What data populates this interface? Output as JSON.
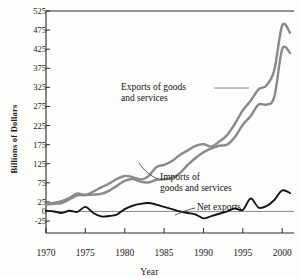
{
  "chart_data": {
    "type": "line",
    "title": "",
    "xlabel": "Year",
    "ylabel": "Billions of Dollars",
    "xlim": [
      1970,
      2001.5
    ],
    "ylim": [
      -25,
      525
    ],
    "grid": false,
    "legend_position": "inline-annotations",
    "xticks": [
      "1970",
      "1975",
      "1980",
      "1985",
      "1990",
      "1995",
      "2000"
    ],
    "xtick_values": [
      1970,
      1975,
      1980,
      1985,
      1990,
      1995,
      2000
    ],
    "yticks": [
      "525",
      "475",
      "425",
      "375",
      "325",
      "275",
      "225",
      "175",
      "125",
      "75",
      "25",
      "0",
      "-25"
    ],
    "ytick_values": [
      525,
      475,
      425,
      375,
      325,
      275,
      225,
      175,
      125,
      75,
      25,
      0,
      -25
    ],
    "x": [
      1970,
      1971,
      1972,
      1973,
      1974,
      1975,
      1976,
      1977,
      1978,
      1979,
      1980,
      1981,
      1982,
      1983,
      1984,
      1985,
      1986,
      1987,
      1988,
      1989,
      1990,
      1991,
      1992,
      1993,
      1994,
      1995,
      1996,
      1997,
      1998,
      1999,
      2000,
      2001
    ],
    "series": [
      {
        "name": "Exports of goods and services",
        "color": "#8a8a8a",
        "values": [
          18,
          20,
          22,
          32,
          42,
          43,
          44,
          46,
          54,
          67,
          80,
          85,
          78,
          76,
          83,
          84,
          88,
          100,
          122,
          140,
          155,
          165,
          172,
          175,
          195,
          227,
          250,
          280,
          280,
          300,
          425,
          415
        ]
      },
      {
        "name": "Imports of goods and services",
        "color": "#8a8a8a",
        "values": [
          20,
          22,
          27,
          36,
          47,
          43,
          52,
          63,
          73,
          85,
          93,
          90,
          84,
          92,
          116,
          122,
          132,
          148,
          160,
          172,
          176,
          170,
          183,
          200,
          230,
          265,
          290,
          320,
          330,
          370,
          487,
          468
        ]
      },
      {
        "name": "Net exports",
        "color": "#141414",
        "values": [
          2,
          0,
          -4,
          2,
          -1,
          12,
          -4,
          -13,
          -12,
          -8,
          6,
          15,
          20,
          22,
          18,
          12,
          6,
          0,
          -4,
          -8,
          -18,
          -12,
          -6,
          0,
          8,
          4,
          34,
          10,
          14,
          30,
          55,
          48
        ]
      }
    ],
    "annotations": [
      {
        "id": "exports",
        "text_line1": "Exports of goods",
        "text_line2": "and services",
        "target_series": "Exports of goods and services"
      },
      {
        "id": "imports",
        "text_line1": "Imports of",
        "text_line2": "goods and services",
        "target_series": "Imports of goods and services"
      },
      {
        "id": "net",
        "text_line1": "Net exports",
        "text_line2": "",
        "target_series": "Net exports"
      }
    ]
  }
}
